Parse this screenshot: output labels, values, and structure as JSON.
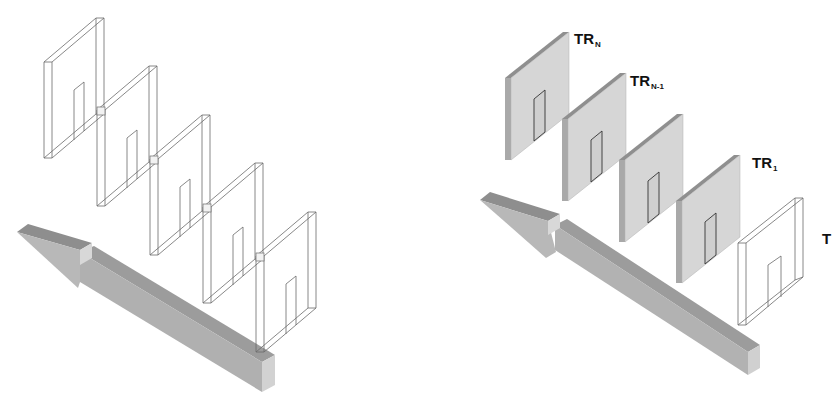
{
  "figure": {
    "left_panel": {
      "frame_count": 5,
      "frame_style": "wireframe",
      "arrow_direction": "up-left"
    },
    "right_panel": {
      "frames": [
        {
          "id": "TR_N",
          "style": "shaded"
        },
        {
          "id": "TR_N-1",
          "style": "shaded"
        },
        {
          "id": "TR_mid",
          "style": "shaded"
        },
        {
          "id": "TR_1",
          "style": "shaded"
        },
        {
          "id": "T",
          "style": "wireframe"
        }
      ],
      "arrow_direction": "up-left"
    }
  },
  "labels": {
    "tr_n": {
      "main": "TR",
      "sub": "N"
    },
    "tr_n1": {
      "main": "TR",
      "sub": "N-1"
    },
    "tr_1": {
      "main": "TR",
      "sub": "1"
    },
    "t": {
      "main": "T"
    }
  },
  "colors": {
    "line": "#555555",
    "panel_face": "#d4d4d4",
    "panel_edge": "#a8a8a8",
    "panel_top": "#8c8c8c",
    "arrow_top": "#9a9a9a",
    "arrow_side": "#b4b4b4",
    "arrow_end": "#cfcfcf"
  }
}
